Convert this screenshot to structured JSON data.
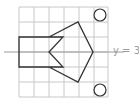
{
  "diagram": {
    "type": "grid-reflection",
    "grid": {
      "cols": 6,
      "rows": 6,
      "origin_px": [
        19,
        7
      ],
      "cell_px": 15,
      "line_color": "#c8c8c8"
    },
    "mirror_line": {
      "label": "y = 3",
      "y_px": 52,
      "color": "#9a9a9a"
    },
    "shape": {
      "stroke": "#333333",
      "rectangle": [
        [
          19,
          37
        ],
        [
          49,
          37
        ],
        [
          49,
          67
        ],
        [
          19,
          67
        ]
      ],
      "pentagon_outline": [
        [
          49,
          37
        ],
        [
          78,
          22
        ],
        [
          93,
          52
        ],
        [
          78,
          82
        ],
        [
          49,
          67
        ],
        [
          63,
          67
        ],
        [
          49,
          52
        ],
        [
          63,
          37
        ]
      ]
    },
    "circles": [
      {
        "cx": 100,
        "cy": 15,
        "r": 6
      },
      {
        "cx": 100,
        "cy": 90,
        "r": 6
      }
    ]
  }
}
